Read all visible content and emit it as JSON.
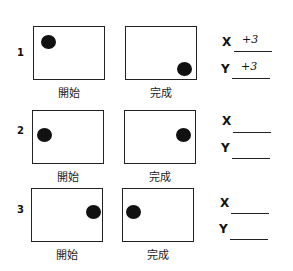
{
  "rows": [
    {
      "number": "1",
      "start_label": "開始",
      "end_label": "完成",
      "x_label": "X",
      "y_label": "Y",
      "x_value": "+3",
      "y_value": "+3"
    },
    {
      "number": "2",
      "start_label": "開始",
      "end_label": "完成",
      "x_label": "X",
      "y_label": "Y",
      "x_value": "",
      "y_value": ""
    },
    {
      "number": "3",
      "start_label": "開始",
      "end_label": "完成",
      "x_label": "X",
      "y_label": "Y",
      "x_value": "",
      "y_value": ""
    }
  ]
}
